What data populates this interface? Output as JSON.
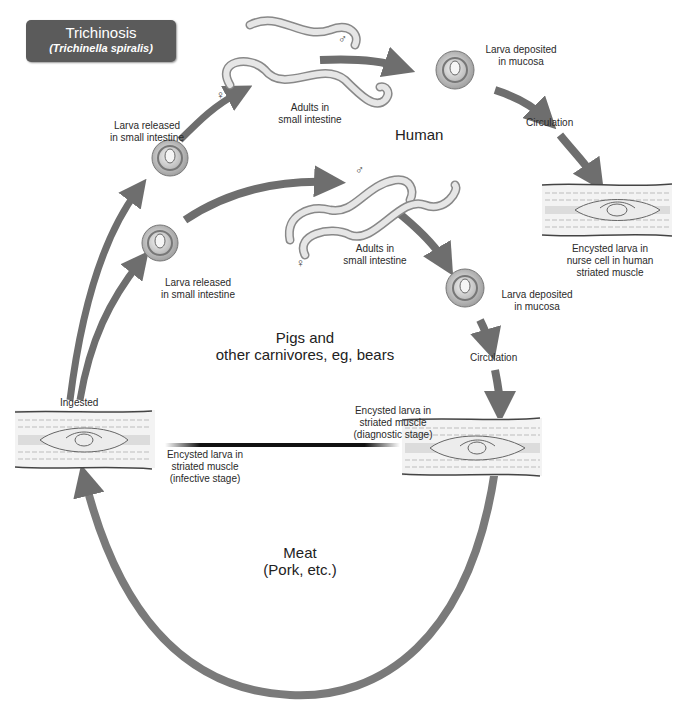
{
  "title": {
    "name": "Trichinosis",
    "species": "(Trichinella spiralis)"
  },
  "hosts": {
    "human": "Human",
    "pigs_line1": "Pigs and",
    "pigs_line2": "other carnivores, eg, bears",
    "meat_line1": "Meat",
    "meat_line2": "(Pork, etc.)"
  },
  "human_cycle": {
    "larva_released_1": "Larva released",
    "larva_released_2": "in small intestine",
    "adults_1": "Adults in",
    "adults_2": "small intestine",
    "male_symbol": "♂",
    "female_symbol": "♀",
    "deposited_1": "Larva deposited",
    "deposited_2": "in mucosa",
    "circulation": "Circulation",
    "encysted_1": "Encysted larva in",
    "encysted_2": "nurse cell in human",
    "encysted_3": "striated muscle"
  },
  "animal_cycle": {
    "larva_released_1": "Larva released",
    "larva_released_2": "in small intestine",
    "adults_1": "Adults in",
    "adults_2": "small intestine",
    "male_symbol": "♂",
    "female_symbol": "♀",
    "deposited_1": "Larva deposited",
    "deposited_2": "in mucosa",
    "circulation": "Circulation",
    "diag_1": "Encysted larva in",
    "diag_2": "striated muscle",
    "diag_3": "(diagnostic stage)",
    "ingested": "Ingested",
    "infective_1": "Encysted larva in",
    "infective_2": "striated muscle",
    "infective_3": "(infective stage)"
  },
  "colors": {
    "arrow": "#6e6e6e",
    "title_bg": "#5b5b5b",
    "muscle_fiber": "#d8d8d8"
  }
}
